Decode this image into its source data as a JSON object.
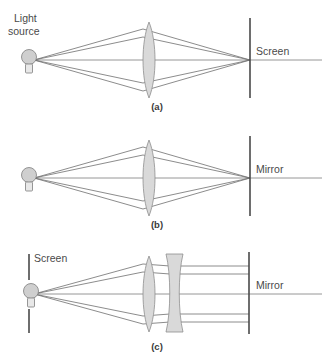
{
  "figure": {
    "background_color": "#ffffff",
    "colors": {
      "ray": "#6e6e6e",
      "axis": "#8a8a8a",
      "barrier": "#4a4a4a",
      "lens_fill": "#d9d9d9",
      "lens_stroke": "#8e8e8e",
      "bulb_fill": "#cfcfcf",
      "text": "#4a4a4a"
    }
  },
  "panels": [
    {
      "id": "a",
      "caption": "(a)",
      "source_label_line1": "Light",
      "source_label_line2": "source",
      "target_label": "Screen",
      "source_icon": "light-bulb-icon",
      "elements": [
        "light-source-bulb",
        "convex-lens",
        "screen-barrier",
        "optical-axis",
        "converging-rays"
      ]
    },
    {
      "id": "b",
      "caption": "(b)",
      "source_label_line1": "",
      "source_label_line2": "",
      "target_label": "Mirror",
      "source_icon": "light-bulb-icon",
      "elements": [
        "light-source-bulb",
        "convex-lens",
        "mirror-barrier",
        "optical-axis",
        "converging-rays"
      ]
    },
    {
      "id": "c",
      "caption": "(c)",
      "source_label_line1": "Screen",
      "source_label_line2": "",
      "target_label": "Mirror",
      "source_icon": "light-bulb-icon",
      "elements": [
        "light-source-bulb",
        "screen-barrier-split",
        "convex-lens",
        "concave-lens",
        "mirror-barrier",
        "optical-axis",
        "collimated-rays"
      ]
    }
  ]
}
